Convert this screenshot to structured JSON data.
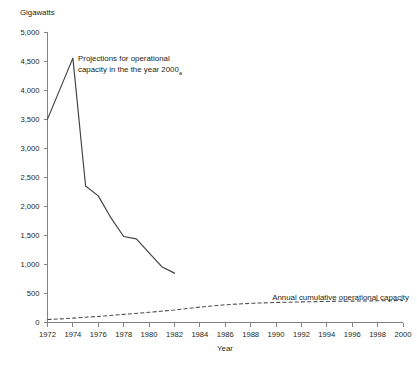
{
  "chart_data": {
    "type": "line",
    "title": "",
    "ylabel": "Gigawatts",
    "xlabel": "Year",
    "ylim": [
      0,
      5000
    ],
    "xlim": [
      1972,
      2000
    ],
    "grid": false,
    "legend_position": "inline-annotation",
    "y_ticks": [
      0,
      500,
      1000,
      1500,
      2000,
      2500,
      3000,
      3500,
      4000,
      4500,
      5000
    ],
    "y_tick_labels": [
      "0",
      "500",
      "1,000",
      "1,500",
      "2,000",
      "2,500",
      "3,000",
      "3,500",
      "4,000",
      "4,500",
      "5,000"
    ],
    "x_ticks": [
      1972,
      1974,
      1976,
      1978,
      1980,
      1982,
      1984,
      1986,
      1988,
      1990,
      1992,
      1994,
      1996,
      1998,
      2000
    ],
    "x_tick_labels": [
      "1972",
      "1974",
      "1976",
      "1978",
      "1980",
      "1982",
      "1984",
      "1986",
      "1988",
      "1990",
      "1992",
      "1994",
      "1996",
      "1998",
      "2000"
    ],
    "series": [
      {
        "name": "Projections for operational capacity in the the year 2000",
        "style": "solid",
        "color": "#3f3f44",
        "x": [
          1972,
          1974,
          1975,
          1976,
          1977,
          1978,
          1979,
          1980,
          1981,
          1982
        ],
        "values": [
          3500,
          4550,
          2350,
          2180,
          1800,
          1480,
          1440,
          1200,
          960,
          850
        ]
      },
      {
        "name": "Annual cumulative operational capacity",
        "style": "dashed",
        "color": "#4a4a4f",
        "x": [
          1972,
          1974,
          1976,
          1978,
          1980,
          1982,
          1984,
          1986,
          1988,
          1990,
          1992,
          1994,
          1996,
          1998,
          2000
        ],
        "values": [
          50,
          75,
          105,
          140,
          175,
          215,
          265,
          305,
          330,
          345,
          355,
          362,
          368,
          373,
          378
        ]
      }
    ],
    "annotations": [
      {
        "name": "projection-annotation",
        "line1": "Projections for operational",
        "line2": "capacity in the the year 2000",
        "footnote_marker": "a",
        "x_px": 78,
        "y_px": 58
      },
      {
        "name": "cumulative-series-label",
        "text": "Annual cumulative operational capacity",
        "x_px": 409,
        "y_px": 299
      }
    ]
  }
}
